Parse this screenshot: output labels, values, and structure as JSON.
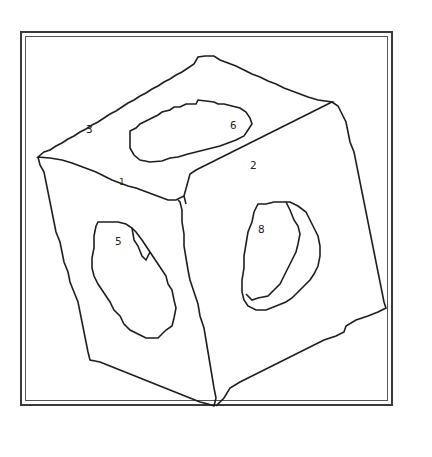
{
  "figure": {
    "type": "contour-line-drawing",
    "line_color": "#1e1e1e",
    "background": "#ffffff"
  },
  "labels": [
    {
      "id": "3",
      "text": "3",
      "x": 86,
      "y": 131
    },
    {
      "id": "6",
      "text": "6",
      "x": 231,
      "y": 126
    },
    {
      "id": "2",
      "text": "2",
      "x": 250,
      "y": 164
    },
    {
      "id": "1",
      "text": "1",
      "x": 121,
      "y": 183
    },
    {
      "id": "5",
      "text": "5",
      "x": 116,
      "y": 240
    },
    {
      "id": "8",
      "text": "8",
      "x": 258,
      "y": 229
    }
  ]
}
